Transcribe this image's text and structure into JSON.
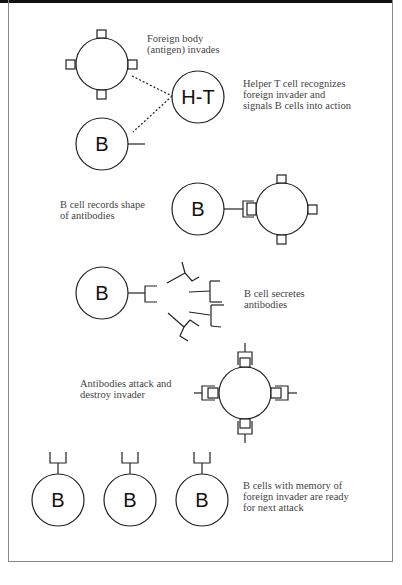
{
  "diagram": {
    "steps": [
      {
        "id": "antigen",
        "label": "Foreign body\n(antigen) invades"
      },
      {
        "id": "helper",
        "label": "Helper T cell recognizes\nforeign invader and\nsignals B cells into action"
      },
      {
        "id": "record",
        "label": "B cell records shape\nof antibodies"
      },
      {
        "id": "secrete",
        "label": "B cell secretes\nantibodies"
      },
      {
        "id": "attack",
        "label": "Antibodies attack and\ndestroy invader"
      },
      {
        "id": "memory",
        "label": "B cells with memory of\nforeign invader are ready\nfor next attack"
      }
    ],
    "cell_labels": {
      "b_cell": "B",
      "helper_t": "H-T"
    }
  }
}
